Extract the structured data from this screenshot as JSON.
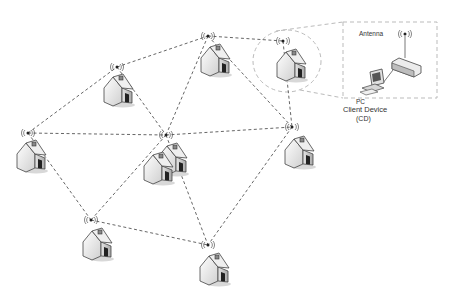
{
  "diagram": {
    "type": "wireless mesh network",
    "colors": {
      "link": "#555555",
      "zoom_outline": "#bbbbbb",
      "house_fill": "#f2f2f2",
      "house_shadow": "#9a9a9a",
      "stroke": "#444444"
    },
    "nodes": [
      {
        "id": "n-topleft",
        "antenna": [
          117,
          67
        ],
        "houses": [
          [
            103,
            72
          ]
        ]
      },
      {
        "id": "n-top",
        "antenna": [
          208,
          36
        ],
        "houses": [
          [
            200,
            42
          ]
        ]
      },
      {
        "id": "n-topright",
        "antenna": [
          283,
          41
        ],
        "houses": [
          [
            276,
            47
          ]
        ]
      },
      {
        "id": "n-left",
        "antenna": [
          28,
          133
        ],
        "houses": [
          [
            16,
            138
          ]
        ]
      },
      {
        "id": "n-center",
        "antenna": [
          166,
          135
        ],
        "houses": [
          [
            157,
            141
          ],
          [
            143,
            150
          ]
        ]
      },
      {
        "id": "n-right",
        "antenna": [
          292,
          127
        ],
        "houses": [
          [
            284,
            134
          ]
        ]
      },
      {
        "id": "n-bottomleft",
        "antenna": [
          91,
          220
        ],
        "houses": [
          [
            82,
            226
          ]
        ]
      },
      {
        "id": "n-bottomright",
        "antenna": [
          208,
          245
        ],
        "houses": [
          [
            199,
            251
          ]
        ]
      }
    ],
    "links": [
      [
        "n-topleft",
        "n-top"
      ],
      [
        "n-top",
        "n-topright"
      ],
      [
        "n-left",
        "n-topleft"
      ],
      [
        "n-topleft",
        "n-center"
      ],
      [
        "n-top",
        "n-center"
      ],
      [
        "n-top",
        "n-right"
      ],
      [
        "n-topright",
        "n-right"
      ],
      [
        "n-left",
        "n-center"
      ],
      [
        "n-center",
        "n-right"
      ],
      [
        "n-left",
        "n-bottomleft"
      ],
      [
        "n-center",
        "n-bottomleft"
      ],
      [
        "n-center",
        "n-bottomright"
      ],
      [
        "n-right",
        "n-bottomright"
      ],
      [
        "n-bottomleft",
        "n-bottomright"
      ]
    ],
    "detail_box": {
      "antenna_label": "Antenna",
      "pc_label": "PC",
      "client_device_label": "Client Device",
      "client_device_abbr": "(CD)"
    }
  }
}
